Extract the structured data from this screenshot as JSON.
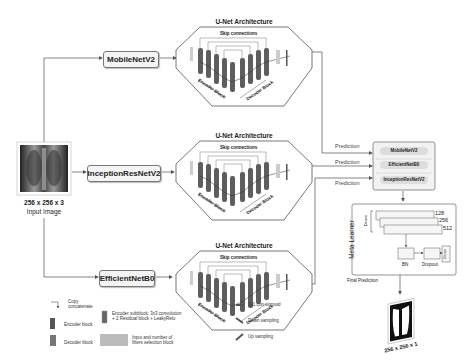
{
  "input": {
    "size_label": "256 x 256 x 3",
    "caption": "Input Image"
  },
  "backbones": [
    {
      "name": "MobileNetV2"
    },
    {
      "name": "InceptionResNetV2"
    },
    {
      "name": "EfficientNetB0"
    }
  ],
  "unet": {
    "title": "U-Net Architecture",
    "skip_label": "Skip connections",
    "encoder_label": "Encoder Block",
    "decoder_label": "Decoder Block"
  },
  "predictions": {
    "label": "Prediction",
    "stack": [
      "MobileNetV2",
      "EfficientNetB0",
      "InceptionResNetV2"
    ]
  },
  "meta_learner": {
    "title": "Meta Learner",
    "dense_label": "Dense",
    "units": [
      "128",
      "256",
      "512"
    ],
    "bn_label": "BN",
    "dropout_label": "Dropout",
    "final_dense_label": "Dense"
  },
  "output": {
    "final_label": "Final Prediction",
    "size_label": "256 x 256 x 1"
  },
  "legend": {
    "copy_concat": "Copy\nconcatenate",
    "encoder_block": "Encoder block",
    "decoder_block": "Decoder block",
    "encoder_subblock": "Encoder subblock: 3x3 convolution\n+ 2 Residual block + LeakyRelu",
    "input_filters": "Input and number of\nfilters selection block",
    "conv_sigmoid": "1x1 con sigmoid",
    "down_sampling": "Down sampling",
    "up_sampling": "Up sampling"
  },
  "colors": {
    "encoder": "#5a5a5a",
    "decoder": "#6e6e6e",
    "line": "#666666",
    "box_bg": "#f3f3f3"
  }
}
